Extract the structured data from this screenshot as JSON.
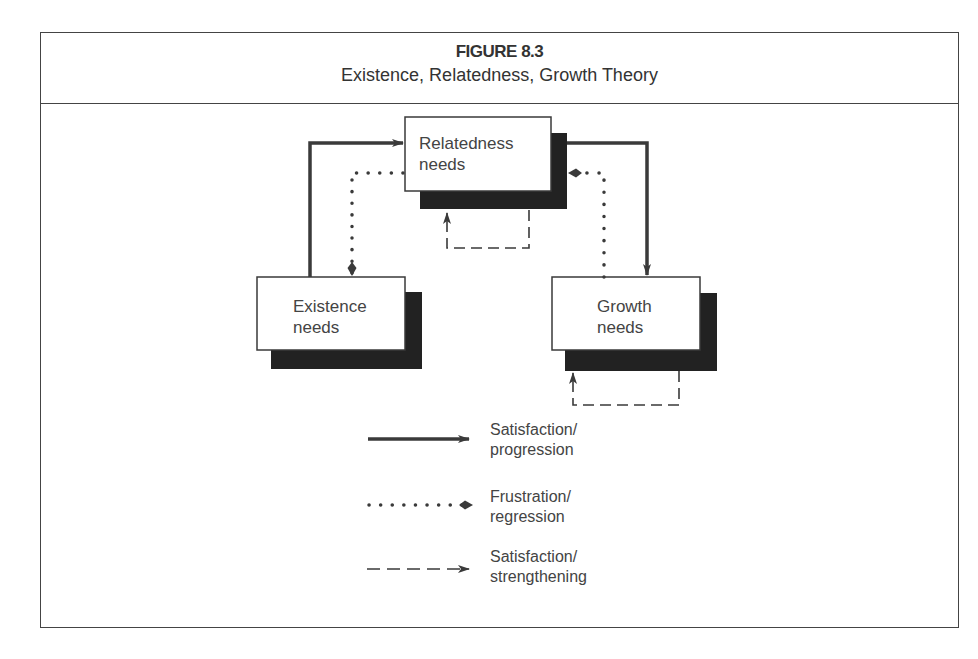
{
  "figure": {
    "number": "FIGURE 8.3",
    "title": "Existence, Relatedness, Growth Theory"
  },
  "nodes": {
    "relatedness": {
      "line1": "Relatedness",
      "line2": "needs"
    },
    "existence": {
      "line1": "Existence",
      "line2": "needs"
    },
    "growth": {
      "line1": "Growth",
      "line2": "needs"
    }
  },
  "edges": [
    {
      "from": "existence",
      "to": "relatedness",
      "type": "satisfaction-progression"
    },
    {
      "from": "relatedness",
      "to": "growth",
      "type": "satisfaction-progression"
    },
    {
      "from": "relatedness",
      "to": "existence",
      "type": "frustration-regression"
    },
    {
      "from": "growth",
      "to": "relatedness",
      "type": "frustration-regression"
    },
    {
      "from": "relatedness",
      "to": "relatedness",
      "type": "satisfaction-strengthening"
    },
    {
      "from": "growth",
      "to": "growth",
      "type": "satisfaction-strengthening"
    }
  ],
  "legend": [
    {
      "style": "solid",
      "line1": "Satisfaction/",
      "line2": "progression"
    },
    {
      "style": "dotted",
      "line1": "Frustration/",
      "line2": "regression"
    },
    {
      "style": "dashed",
      "line1": "Satisfaction/",
      "line2": "strengthening"
    }
  ],
  "colors": {
    "stroke": "#3a3a3a",
    "shadow": "#222222",
    "box_fill": "#ffffff"
  }
}
